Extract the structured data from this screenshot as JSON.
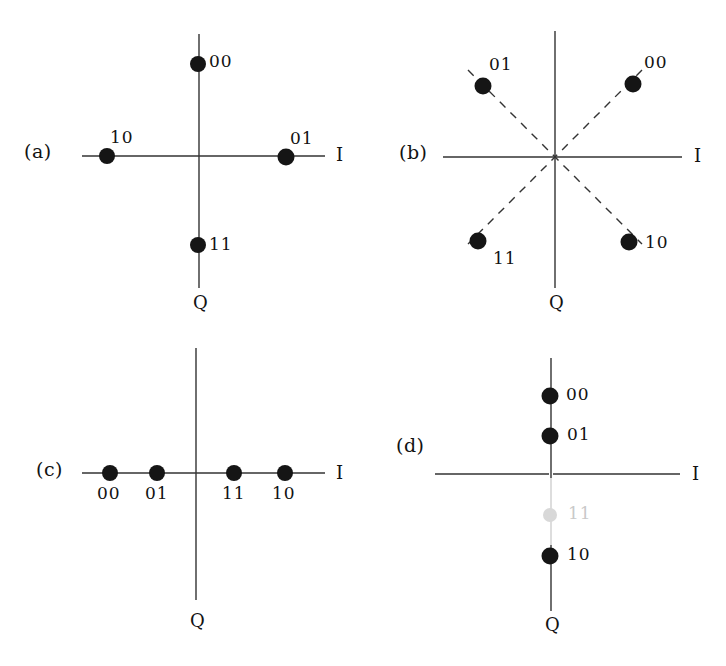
{
  "figure": {
    "background_color": "#ffffff",
    "ink_color": "#121212",
    "faded_ink_color": "#c9c9c9"
  },
  "panels": [
    {
      "id": "a",
      "tag": "(a)",
      "axis_i_label": "I",
      "axis_q_label": "Q",
      "guide_lines": "none",
      "points": [
        {
          "code": "00",
          "i": 0,
          "q": 1,
          "label_pos": "right"
        },
        {
          "code": "01",
          "i": 1,
          "q": 0,
          "label_pos": "above-right"
        },
        {
          "code": "11",
          "i": 0,
          "q": -1,
          "label_pos": "right"
        },
        {
          "code": "10",
          "i": -1,
          "q": 0,
          "label_pos": "above-right"
        }
      ]
    },
    {
      "id": "b",
      "tag": "(b)",
      "axis_i_label": "I",
      "axis_q_label": "Q",
      "guide_lines": "dashed-diagonals",
      "points": [
        {
          "code": "00",
          "i": 0.707,
          "q": 0.707,
          "label_pos": "above-right"
        },
        {
          "code": "01",
          "i": -0.707,
          "q": 0.707,
          "label_pos": "above-right"
        },
        {
          "code": "11",
          "i": -0.707,
          "q": -0.707,
          "label_pos": "below-right"
        },
        {
          "code": "10",
          "i": 0.707,
          "q": -0.707,
          "label_pos": "right"
        }
      ]
    },
    {
      "id": "c",
      "tag": "(c)",
      "axis_i_label": "I",
      "axis_q_label": "Q",
      "guide_lines": "none",
      "points": [
        {
          "code": "00",
          "i": -1.5,
          "q": 0,
          "label_pos": "below"
        },
        {
          "code": "01",
          "i": -0.5,
          "q": 0,
          "label_pos": "below"
        },
        {
          "code": "11",
          "i": 0.5,
          "q": 0,
          "label_pos": "below"
        },
        {
          "code": "10",
          "i": 1.5,
          "q": 0,
          "label_pos": "below"
        }
      ]
    },
    {
      "id": "d",
      "tag": "(d)",
      "axis_i_label": "I",
      "axis_q_label": "Q",
      "guide_lines": "none",
      "points": [
        {
          "code": "00",
          "i": 0,
          "q": 1.5,
          "label_pos": "right",
          "faded": false
        },
        {
          "code": "01",
          "i": 0,
          "q": 0.5,
          "label_pos": "right",
          "faded": false
        },
        {
          "code": "11",
          "i": 0,
          "q": -0.5,
          "label_pos": "right",
          "faded": true
        },
        {
          "code": "10",
          "i": 0,
          "q": -1.5,
          "label_pos": "right",
          "faded": false
        }
      ]
    }
  ]
}
